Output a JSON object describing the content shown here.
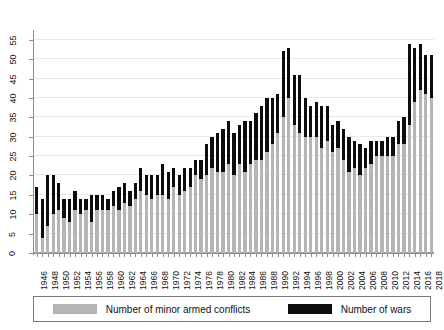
{
  "chart_data": {
    "type": "bar",
    "stacked": true,
    "title": "",
    "subtitle": "",
    "xlabel": "",
    "ylabel": "",
    "ylim": [
      0,
      57
    ],
    "yticks": [
      0,
      5,
      10,
      15,
      20,
      25,
      30,
      35,
      40,
      45,
      50,
      55
    ],
    "grid": true,
    "legend_position": "bottom",
    "categories": [
      1946,
      1947,
      1948,
      1949,
      1950,
      1951,
      1952,
      1953,
      1954,
      1955,
      1956,
      1957,
      1958,
      1959,
      1960,
      1961,
      1962,
      1963,
      1964,
      1965,
      1966,
      1967,
      1968,
      1969,
      1970,
      1971,
      1972,
      1973,
      1974,
      1975,
      1976,
      1977,
      1978,
      1979,
      1980,
      1981,
      1982,
      1983,
      1984,
      1985,
      1986,
      1987,
      1988,
      1989,
      1990,
      1991,
      1992,
      1993,
      1994,
      1995,
      1996,
      1997,
      1998,
      1999,
      2000,
      2001,
      2002,
      2003,
      2004,
      2005,
      2006,
      2007,
      2008,
      2009,
      2010,
      2011,
      2012,
      2013,
      2014,
      2015,
      2016,
      2017,
      2018
    ],
    "xtick_labels": [
      "1946",
      "1948",
      "1950",
      "1952",
      "1954",
      "1956",
      "1958",
      "1960",
      "1962",
      "1964",
      "1966",
      "1968",
      "1970",
      "1972",
      "1974",
      "1976",
      "1978",
      "1980",
      "1982",
      "1984",
      "1986",
      "1988",
      "1990",
      "1992",
      "1994",
      "1996",
      "1998",
      "2000",
      "2002",
      "2004",
      "2006",
      "2008",
      "2010",
      "2012",
      "2014",
      "2016",
      "2018"
    ],
    "series": [
      {
        "name": "Number of minor armed conflicts",
        "color": "#b5b5b5",
        "values": [
          10,
          4,
          7,
          10,
          11,
          9,
          8,
          11,
          10,
          11,
          8,
          11,
          11,
          11,
          12,
          11,
          13,
          12,
          14,
          16,
          15,
          14,
          15,
          15,
          14,
          17,
          15,
          16,
          17,
          20,
          19,
          20,
          22,
          21,
          21,
          23,
          20,
          23,
          21,
          23,
          24,
          24,
          26,
          28,
          31,
          35,
          40,
          33,
          31,
          30,
          30,
          30,
          27,
          29,
          26,
          27,
          24,
          21,
          22,
          20,
          22,
          23,
          25,
          25,
          25,
          25,
          28,
          28,
          33,
          39,
          42,
          41,
          40
        ]
      },
      {
        "name": "Number of wars",
        "color": "#0d0d0d",
        "values": [
          7,
          10,
          13,
          10,
          7,
          5,
          6,
          5,
          4,
          3,
          7,
          4,
          4,
          3,
          4,
          6,
          5,
          4,
          4,
          6,
          5,
          6,
          5,
          8,
          7,
          5,
          5,
          6,
          5,
          4,
          5,
          8,
          8,
          10,
          11,
          11,
          11,
          10,
          13,
          11,
          12,
          14,
          14,
          12,
          10,
          17,
          13,
          13,
          15,
          10,
          8,
          9,
          11,
          9,
          7,
          7,
          8,
          9,
          7,
          8,
          5,
          6,
          4,
          4,
          5,
          5,
          6,
          7,
          21,
          14,
          12,
          10,
          11
        ]
      }
    ],
    "peak_year": 2014,
    "peak_total": 54
  },
  "legend": {
    "entries": [
      {
        "label": "Number of minor armed conflicts",
        "swatch": "minor"
      },
      {
        "label": "Number of wars",
        "swatch": "wars"
      }
    ]
  }
}
